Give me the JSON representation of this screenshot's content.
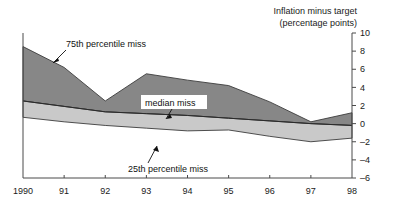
{
  "chart_data": {
    "type": "area",
    "title": "Inflation minus target",
    "subtitle": "(percentage points)",
    "xlabel": "",
    "ylabel": "",
    "x": [
      1990,
      1991,
      1992,
      1993,
      1994,
      1995,
      1996,
      1997,
      1998
    ],
    "xtick_labels": [
      "1990",
      "91",
      "92",
      "93",
      "94",
      "95",
      "96",
      "97",
      "98"
    ],
    "ytick_labels": [
      "10",
      "8",
      "6",
      "4",
      "2",
      "0",
      "-2",
      "-4",
      "-6"
    ],
    "ytick_values": [
      10,
      8,
      6,
      4,
      2,
      0,
      -2,
      -4,
      -6
    ],
    "ylim": [
      -6,
      10
    ],
    "xlim": [
      1990,
      1998
    ],
    "grid": false,
    "legend_position": "inline-annotations",
    "series": [
      {
        "name": "75th percentile miss",
        "values": [
          8.5,
          6.2,
          2.5,
          5.5,
          4.8,
          4.2,
          2.4,
          0.2,
          1.2
        ]
      },
      {
        "name": "median miss",
        "values": [
          2.5,
          1.9,
          1.3,
          1.1,
          0.9,
          0.6,
          0.3,
          0.0,
          -0.2
        ]
      },
      {
        "name": "25th percentile miss",
        "values": [
          0.7,
          0.2,
          -0.2,
          -0.5,
          -0.8,
          -0.7,
          -1.4,
          -2.0,
          -1.6
        ]
      }
    ],
    "annotations": [
      {
        "name": "p75-annotation",
        "text": "75th percentile miss"
      },
      {
        "name": "median-annotation",
        "text": "median miss"
      },
      {
        "name": "p25-annotation",
        "text": "25th percentile miss"
      }
    ],
    "colors": {
      "upper_band": "#878787",
      "lower_band": "#c9c9c9",
      "axis": "#4a4a4a",
      "text": "#111111"
    }
  }
}
